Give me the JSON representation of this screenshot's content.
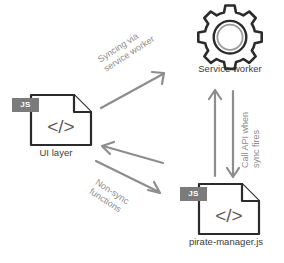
{
  "diagram": {
    "background_color": "#ffffff",
    "node_stroke_color": "#2b2b2b",
    "arrow_color": "#8d8d8d",
    "badge_color": "#7b7b7b",
    "label_color": "#3b3b3b",
    "nodes": [
      {
        "id": "ui-layer",
        "label": "UI layer",
        "icon": "js-file-icon",
        "badge": "JS",
        "code_glyph": "</>"
      },
      {
        "id": "service-worker",
        "label": "Service worker",
        "icon": "gear-icon"
      },
      {
        "id": "pirate-manager",
        "label": "pirate-manager.js",
        "icon": "js-file-icon",
        "badge": "JS",
        "code_glyph": "</>"
      }
    ],
    "edges": [
      {
        "id": "sync-via-service-worker",
        "from": "ui-layer",
        "to": "service-worker",
        "label_line1": "Syncing via",
        "label_line2": "service worker",
        "direction": "one-way"
      },
      {
        "id": "non-sync-functions",
        "from": "ui-layer",
        "to": "pirate-manager",
        "label_line1": "Non-sync",
        "label_line2": "functions",
        "direction": "two-way"
      },
      {
        "id": "call-api-when-sync-fires",
        "from": "service-worker",
        "to": "pirate-manager",
        "label_line1": "Call API when",
        "label_line2": "sync fires",
        "direction": "two-way"
      }
    ]
  }
}
